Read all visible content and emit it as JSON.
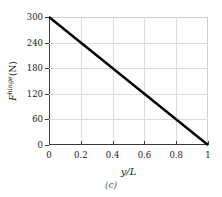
{
  "figure": {
    "caption": "(c)",
    "background_color": "#ffffff",
    "line_color": "#000000",
    "grid_color": "#dcdcdc",
    "axis_color": "#3a3a3a"
  },
  "chart_data": {
    "type": "line",
    "title": "",
    "subtitle": "",
    "xlabel": "y/L",
    "ylabel_symbol": "F",
    "ylabel_superscript": "hinge",
    "ylabel_unit": "(N)",
    "ylabel": "F hinge (N)",
    "x": [
      0,
      0.2,
      0.4,
      0.6,
      0.8,
      1.0
    ],
    "values": [
      300,
      240,
      180,
      120,
      60,
      0
    ],
    "series": [
      {
        "name": "F_hinge",
        "x": [
          0,
          1
        ],
        "values": [
          300,
          0
        ]
      }
    ],
    "xlim": [
      0,
      1
    ],
    "ylim": [
      0,
      300
    ],
    "xticks": [
      0,
      0.2,
      0.4,
      0.6,
      0.8,
      1
    ],
    "xticklabels": [
      "0",
      "0.2",
      "0.4",
      "0.6",
      "0.8",
      "1"
    ],
    "yticks": [
      0,
      60,
      120,
      180,
      240,
      300
    ],
    "yticklabels": [
      "0",
      "60",
      "120",
      "180",
      "240",
      "300"
    ],
    "grid": true,
    "grid_axes": "both",
    "legend": false,
    "legend_position": "none",
    "annotations": [
      "(c)"
    ],
    "line_width_px": 2.4,
    "slope": -300,
    "intercept": 300
  }
}
